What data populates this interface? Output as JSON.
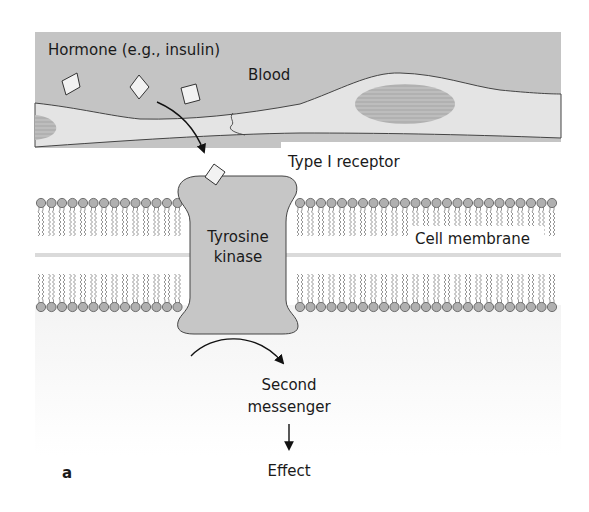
{
  "diagram": {
    "panel_label": "a",
    "labels": {
      "hormone": "Hormone (e.g., insulin)",
      "blood": "Blood",
      "receptor": "Type I receptor",
      "enzyme_line1": "Tyrosine",
      "enzyme_line2": "kinase",
      "membrane": "Cell membrane",
      "messenger_line1": "Second",
      "messenger_line2": "messenger",
      "effect": "Effect"
    },
    "colors": {
      "blood": "#c4c4c4",
      "vessel_wall": "#e4e4e4",
      "nucleus": "#b8b8b8",
      "receptor": "#c6c6c6",
      "lipid_head": "#b0b0b0",
      "lipid_tail": "#8a8a8a",
      "hormone_fill": "#f2f2f2",
      "outline": "#333333",
      "text": "#1a1a1a"
    },
    "hormone_count": 4
  }
}
